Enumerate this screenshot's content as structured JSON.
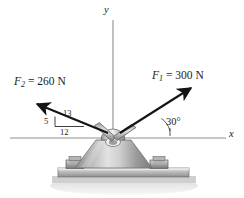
{
  "figure": {
    "type": "free-body-diagram",
    "background_color": "#ffffff",
    "line_color": "#1a1a1a",
    "axis_color": "#8f8f8f"
  },
  "axes": {
    "x_label": "x",
    "y_label": "y",
    "origin_x": 113,
    "origin_y": 138
  },
  "forces": [
    {
      "id": "F1",
      "name": "F",
      "subscript": "1",
      "equals": " = ",
      "magnitude": "300",
      "unit": "N",
      "label": "F1 = 300 N",
      "direction": "up-right",
      "angle_from_x_axis_deg": 30
    },
    {
      "id": "F2",
      "name": "F",
      "subscript": "2",
      "equals": " = ",
      "magnitude": "260",
      "unit": "N",
      "label": "F2 = 260 N",
      "direction": "up-left",
      "slope_triangle": {
        "vertical": "5",
        "horizontal": "12",
        "hypotenuse": "13"
      }
    }
  ],
  "annotations": {
    "angle": "30°",
    "triangle_hypotenuse": "13",
    "triangle_vertical": "5",
    "triangle_horizontal": "12"
  },
  "hardware": {
    "hook": "eyelet-hook",
    "pedestal": "trapezoidal-pedestal",
    "base_plate": "mounting-plate",
    "bolts": [
      "left-hex-bolt",
      "right-hex-bolt"
    ],
    "ground": "ground-slab"
  }
}
